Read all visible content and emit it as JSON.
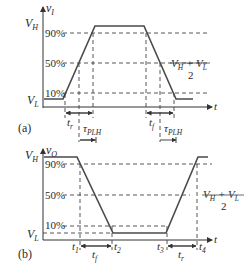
{
  "figure": {
    "panel_a": {
      "label": "(a)",
      "signal": "v",
      "signal_sub": "I",
      "vh": "V",
      "vh_sub": "H",
      "vl": "V",
      "vl_sub": "L",
      "axis_t": "t",
      "pct_90": "90%",
      "pct_50": "50%",
      "pct_10": "10%",
      "mid_num": "V",
      "mid_num_sub1": "H",
      "mid_plus": " + V",
      "mid_num_sub2": "L",
      "mid_den": "2",
      "tr": "t",
      "tr_sub": "r",
      "tf": "t",
      "tf_sub": "f",
      "tau1": "τ",
      "tau1_sub": "PLH",
      "tau2": "τ",
      "tau2_sub": "PLH"
    },
    "panel_b": {
      "label": "(b)",
      "signal": "v",
      "signal_sub": "O",
      "vh": "V",
      "vh_sub": "H",
      "vl": "V",
      "vl_sub": "L",
      "axis_t": "t",
      "pct_90": "90%",
      "pct_50": "50%",
      "pct_10": "10%",
      "mid_num": "V",
      "mid_num_sub1": "H",
      "mid_plus": " + V",
      "mid_num_sub2": "L",
      "mid_den": "2",
      "t1": "t",
      "t1_sub": "1",
      "t2": "t",
      "t2_sub": "2",
      "t3": "t",
      "t3_sub": "3",
      "t4": "t",
      "t4_sub": "4",
      "tf": "t",
      "tf_sub": "f",
      "tr": "t",
      "tr_sub": "r"
    }
  },
  "colors": {
    "line": "#3a3a3a",
    "waveform": "#4a4a4a",
    "text": "#2a2a2a",
    "background": "#ffffff"
  }
}
